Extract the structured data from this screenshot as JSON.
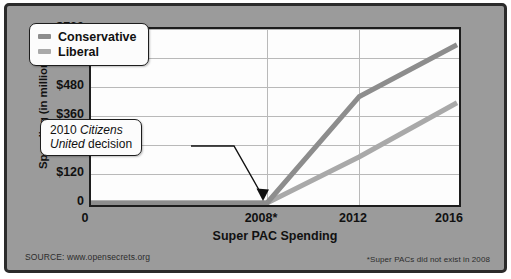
{
  "chart_data": {
    "type": "line",
    "title": "",
    "xlabel": "Super PAC Spending",
    "ylabel": "Spending (in millions)",
    "x": [
      0,
      2008,
      2012,
      2016
    ],
    "xtick_labels": [
      "0",
      "2008*",
      "2012",
      "2016"
    ],
    "ytick_labels": [
      "0",
      "$120",
      "$240",
      "$360",
      "$480",
      "$600",
      "$720"
    ],
    "ytick_values": [
      0,
      120,
      240,
      360,
      480,
      600,
      720
    ],
    "ylim": [
      0,
      720
    ],
    "grid": "both",
    "legend_position": "top-left",
    "series": [
      {
        "name": "Conservative",
        "color": "#8d8d8d",
        "values": [
          0,
          0,
          450,
          670
        ]
      },
      {
        "name": "Liberal",
        "color": "#a9a9a9",
        "values": [
          0,
          0,
          195,
          425
        ]
      }
    ],
    "annotations": [
      {
        "name": "citizens-united-callout",
        "line1_prefix": "2010 ",
        "line1_italic": "Citizens",
        "line2_italic": "United",
        "line2_suffix": " decision",
        "points_to_x": 2008,
        "points_to_y": 0
      }
    ]
  },
  "legend": {
    "items": [
      {
        "label": "Conservative",
        "color": "#8d8d8d"
      },
      {
        "label": "Liberal",
        "color": "#a9a9a9"
      }
    ]
  },
  "axes": {
    "y_title": "Spending (in millions)",
    "x_title": "Super PAC Spending",
    "y_ticks": [
      "$720",
      "$600",
      "$480",
      "$360",
      "$240",
      "$120",
      "0"
    ],
    "x_ticks": [
      "0",
      "2008*",
      "2012",
      "2016"
    ]
  },
  "callout": {
    "line1_prefix": "2010 ",
    "line1_italic": "Citizens",
    "line2_italic": "United",
    "line2_suffix": " decision"
  },
  "footer": {
    "source": "SOURCE: www.opensecrets.org",
    "footnote": "*Super PACs did not exist in 2008"
  },
  "colors": {
    "panel_background": "#9b9b9b",
    "plot_background": "#fdfdfd",
    "frame": "#2b2b2b",
    "gridline": "#b9b9b9",
    "conservative": "#8d8d8d",
    "liberal": "#a9a9a9"
  }
}
